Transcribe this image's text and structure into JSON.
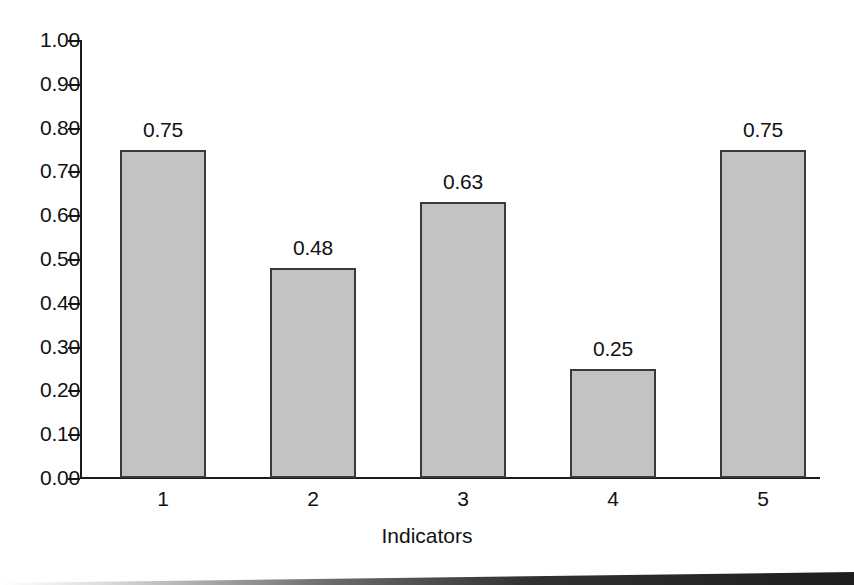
{
  "chart_data": {
    "type": "bar",
    "title": "",
    "xlabel": "Indicators",
    "ylabel": "",
    "categories": [
      "1",
      "2",
      "3",
      "4",
      "5"
    ],
    "values": [
      0.75,
      0.48,
      0.63,
      0.25,
      0.75
    ],
    "value_labels": [
      "0.75",
      "0.48",
      "0.63",
      "0.25",
      "0.75"
    ],
    "ylim": [
      0,
      1
    ],
    "ytick_labels": [
      "1.00",
      "0.90",
      "0.80",
      "0.70",
      "0.60",
      "0.50",
      "0.40",
      "0.30",
      "0.20",
      "0.10",
      "0.00"
    ],
    "ytick_values": [
      1.0,
      0.9,
      0.8,
      0.7,
      0.6,
      0.5,
      0.4,
      0.3,
      0.2,
      0.1,
      0.0
    ],
    "grid": false,
    "legend": null,
    "bar_fill_color": "#c3c3c3",
    "bar_edge_color": "#3a3a3a",
    "axis_color": "#1a1a1a",
    "background_color": "#ffffff"
  }
}
